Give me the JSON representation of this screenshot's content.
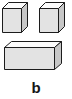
{
  "figure": {
    "label": "b",
    "background_color": "#ffffff",
    "width": 72,
    "height": 99,
    "stroke_color": "#1a1a1a",
    "face_colors": {
      "top": "#fcfcfc",
      "front": "#e2e2e2",
      "side": "#c9c9c9"
    },
    "shapes": [
      {
        "name": "cube-left",
        "kind": "cube",
        "position": "top-left",
        "faces": [
          "top",
          "front",
          "side"
        ]
      },
      {
        "name": "cube-right",
        "kind": "cube",
        "position": "top-right",
        "faces": [
          "top",
          "front",
          "side"
        ]
      },
      {
        "name": "box-wide",
        "kind": "cuboid",
        "position": "bottom-center",
        "faces": [
          "top",
          "front",
          "side"
        ]
      }
    ]
  }
}
